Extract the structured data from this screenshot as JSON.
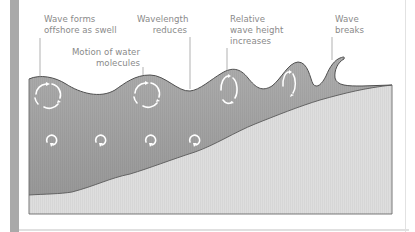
{
  "diagram": {
    "labels": [
      {
        "id": "wave-forms",
        "lines": [
          "Wave forms",
          "offshore as swell"
        ]
      },
      {
        "id": "wavelength",
        "lines": [
          "Wavelength",
          "reduces"
        ]
      },
      {
        "id": "motion",
        "lines": [
          "Motion of water",
          "molecules"
        ]
      },
      {
        "id": "relative-height",
        "lines": [
          "Relative",
          "wave height",
          "increases"
        ]
      },
      {
        "id": "wave-breaks",
        "lines": [
          "Wave",
          "breaks"
        ]
      }
    ],
    "icons": {
      "orbit_large": "orbital-motion-icon",
      "orbit_small": "circular-arrow-icon"
    },
    "colors": {
      "water": "#a3a3a3",
      "water_dark": "#979797",
      "seabed": "#dedede",
      "outline": "#555555",
      "leader": "#8f8f8f",
      "text": "#8a8a8a",
      "side_bar": "#a9a9a9"
    }
  }
}
